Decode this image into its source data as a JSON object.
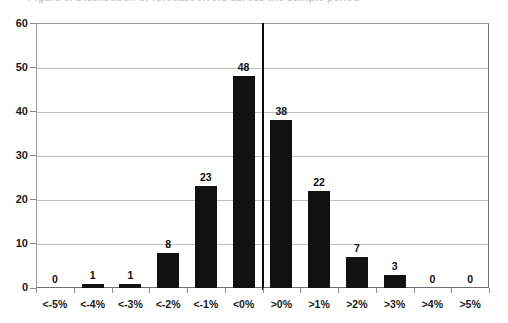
{
  "top_caption": {
    "text": "Figure 3. Distribution of forecast errors across the sample period"
  },
  "chart_data": {
    "type": "bar",
    "title": "",
    "subtitle": "",
    "xlabel": "",
    "ylabel": "",
    "categories": [
      "<-5%",
      "<-4%",
      "<-3%",
      "<-2%",
      "<-1%",
      "<0%",
      ">0%",
      ">1%",
      ">2%",
      ">3%",
      ">4%",
      ">5%"
    ],
    "values": [
      0,
      1,
      1,
      8,
      23,
      48,
      38,
      22,
      7,
      3,
      0,
      0
    ],
    "series": [
      {
        "name": "Frequency",
        "values": [
          0,
          1,
          1,
          8,
          23,
          48,
          38,
          22,
          7,
          3,
          0,
          0
        ]
      }
    ],
    "data_labels": [
      "0",
      "1",
      "1",
      "8",
      "23",
      "48",
      "38",
      "22",
      "7",
      "3",
      "0",
      "0"
    ],
    "ylim": [
      0,
      60
    ],
    "yticks": [
      0,
      10,
      20,
      30,
      40,
      50,
      60
    ],
    "ytick_labels": [
      "0",
      "10",
      "20",
      "30",
      "40",
      "50",
      "60"
    ],
    "grid": true,
    "grid_axis": "y",
    "legend": false,
    "legend_position": "none",
    "bar_color": "#111111",
    "grid_color": "#bfbfbf",
    "axis_color": "#8a8a8a",
    "annotations": [
      {
        "name": "zero-divider",
        "type": "vertical-line",
        "between": [
          "<0%",
          ">0%"
        ],
        "color": "#0d0d0d"
      }
    ]
  }
}
